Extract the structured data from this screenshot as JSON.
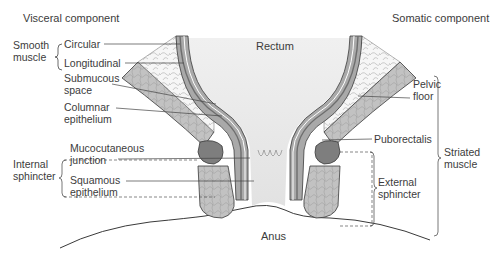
{
  "headers": {
    "visceral": "Visceral component",
    "somatic": "Somatic component"
  },
  "center_labels": {
    "rectum": "Rectum",
    "anus": "Anus"
  },
  "left_groups": {
    "smooth_muscle": "Smooth\nmuscle",
    "internal_sphincter": "Internal\nsphincter"
  },
  "left_labels": {
    "circular": "Circular",
    "longitudinal": "Longitudinal",
    "submucous_space": "Submucous\nspace",
    "columnar_epithelium": "Columnar\nepithelium",
    "mucocutaneous_junction": "Mucocutaneous\njunction",
    "squamous_epithelium": "Squamous\nepithelium"
  },
  "right_labels": {
    "pelvic_floor": "Pelvic\nfloor",
    "puborectalis": "Puborectalis",
    "external_sphincter": "External\nsphincter",
    "striated_muscle": "Striated\nmuscle"
  },
  "colors": {
    "outline": "#3a3a3a",
    "muscle_dark": "#8a8a8a",
    "muscle_mid": "#a8a8a8",
    "muscle_light": "#c4c4c4",
    "fat": "#f4f4f4",
    "lumen": "#e9e9e9",
    "leader": "#444444"
  }
}
